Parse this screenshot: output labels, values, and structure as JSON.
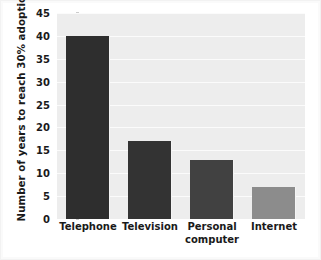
{
  "chart_data": {
    "type": "bar",
    "title": "",
    "subtitle": "",
    "categories": [
      "Telephone",
      "Television",
      "Personal computer",
      "Internet"
    ],
    "category_lines": [
      [
        "Telephone"
      ],
      [
        "Television"
      ],
      [
        "Personal",
        "computer"
      ],
      [
        "Internet"
      ]
    ],
    "values": [
      40,
      17,
      13,
      7
    ],
    "xlabel": "",
    "ylabel": "Number of years to reach 30% adoption rate",
    "ylim": [
      0,
      45
    ],
    "yticks": [
      0,
      5,
      10,
      15,
      20,
      25,
      30,
      35,
      40,
      45
    ],
    "ytick_labels": [
      "0",
      "5",
      "10",
      "15",
      "20",
      "25",
      "30",
      "35",
      "40",
      "45"
    ],
    "grid": true,
    "grid_axis": "y",
    "legend": false,
    "legend_position": "none",
    "bar_colors": [
      "#2e2e2e",
      "#333333",
      "#414141",
      "#8c8c8c"
    ],
    "plot_background": "#ededed",
    "gridline_color": "#fbfbfb",
    "figure_background": "#ffffff",
    "text_color": "#1a1a1a"
  }
}
